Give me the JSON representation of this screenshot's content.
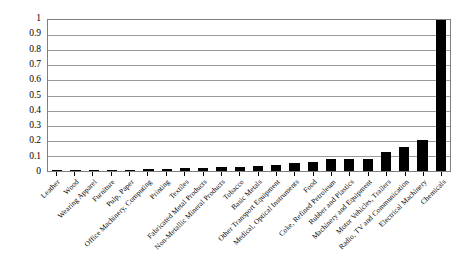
{
  "chart_data": {
    "type": "bar",
    "title": "",
    "subtitle": "",
    "xlabel": "",
    "ylabel": "",
    "ylim": [
      0,
      1
    ],
    "ytick_labels": [
      "1",
      "0.9",
      "0.8",
      "0.7",
      "0.6",
      "0.5",
      "0.4",
      "0.3",
      "0.2",
      "0.1",
      "0"
    ],
    "ytick_values": [
      1,
      0.9,
      0.8,
      0.7,
      0.6,
      0.5,
      0.4,
      0.3,
      0.2,
      0.1,
      0
    ],
    "grid": true,
    "legend": "none",
    "bar_color": "#000000",
    "categories": [
      "Leather",
      "Wood",
      "Wearing Apparel",
      "Furniture",
      "Pulp, Paper",
      "Office Machinery, Computing",
      "Printing",
      "Textiles",
      "Fabricated Metal Products",
      "Non-Metallic Mineral Products",
      "Tobacco",
      "Basic Metals",
      "Other Transport Equipment",
      "Medical, Optical Instruments",
      "Food",
      "Coke, Refined Petroleum",
      "Rubber and Plastics",
      "Machinery and Equipment",
      "Motor Vehicles, Trailers",
      "Radio, TV and Communication",
      "Electrical Machinery",
      "Chemicals"
    ],
    "values": [
      0.003,
      0.005,
      0.006,
      0.008,
      0.01,
      0.012,
      0.014,
      0.017,
      0.02,
      0.024,
      0.028,
      0.034,
      0.042,
      0.05,
      0.063,
      0.08,
      0.078,
      0.082,
      0.123,
      0.158,
      0.205,
      1.0
    ]
  }
}
